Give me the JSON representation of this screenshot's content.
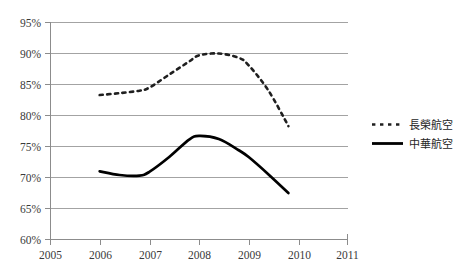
{
  "chart_data": {
    "type": "line",
    "title": "",
    "subtitle": "",
    "xlabel": "",
    "ylabel": "",
    "xlim": [
      2005,
      2011
    ],
    "ylim": [
      0.6,
      0.95
    ],
    "grid": true,
    "legend_position": "right",
    "x_tick_labels": [
      "2005",
      "2006",
      "2007",
      "2008",
      "2009",
      "2010",
      "2011"
    ],
    "x_ticks": [
      2005,
      2006,
      2007,
      2008,
      2009,
      2010,
      2011
    ],
    "y_tick_labels": [
      "95%",
      "90%",
      "85%",
      "80%",
      "75%",
      "70%",
      "65%",
      "60%"
    ],
    "y_ticks": [
      0.95,
      0.9,
      0.85,
      0.8,
      0.75,
      0.7,
      0.65,
      0.6
    ],
    "series": [
      {
        "name": "長榮航空",
        "style": "dashed",
        "color": "#1f1f1f",
        "x": [
          2006,
          2006.4,
          2006.8,
          2007,
          2007.4,
          2007.8,
          2008,
          2008.4,
          2008.8,
          2009,
          2009.4,
          2009.8
        ],
        "values": [
          0.833,
          0.836,
          0.84,
          0.845,
          0.866,
          0.887,
          0.897,
          0.9,
          0.893,
          0.881,
          0.84,
          0.783
        ]
      },
      {
        "name": "中華航空",
        "style": "solid",
        "color": "#000000",
        "x": [
          2006,
          2006.4,
          2006.8,
          2007,
          2007.4,
          2007.8,
          2008,
          2008.4,
          2008.8,
          2009,
          2009.4,
          2009.8
        ],
        "values": [
          0.71,
          0.704,
          0.703,
          0.709,
          0.733,
          0.761,
          0.767,
          0.762,
          0.744,
          0.733,
          0.705,
          0.675
        ]
      }
    ]
  },
  "legend": {
    "items": [
      {
        "label": "長榮航空",
        "marker": "dashed-line-marker"
      },
      {
        "label": "中華航空",
        "marker": "solid-line-marker"
      }
    ]
  },
  "axes": {
    "y_labels": [
      "95%",
      "90%",
      "85%",
      "80%",
      "75%",
      "70%",
      "65%",
      "60%"
    ],
    "x_labels": [
      "2005",
      "2006",
      "2007",
      "2008",
      "2009",
      "2010",
      "2011"
    ]
  }
}
